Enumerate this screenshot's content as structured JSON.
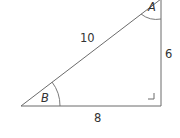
{
  "diagram": {
    "type": "right-triangle",
    "vertices": {
      "A": {
        "label": "A",
        "position": "top-right"
      },
      "B": {
        "label": "B",
        "position": "bottom-left"
      },
      "C": {
        "label": "",
        "position": "bottom-right",
        "right_angle": true
      }
    },
    "sides": {
      "hypotenuse": {
        "from": "B",
        "to": "A",
        "length_label": "10"
      },
      "vertical": {
        "from": "C",
        "to": "A",
        "length_label": "6"
      },
      "horizontal": {
        "from": "B",
        "to": "C",
        "length_label": "8"
      }
    },
    "colors": {
      "line": "#6b6b6b",
      "text": "#333333"
    }
  }
}
